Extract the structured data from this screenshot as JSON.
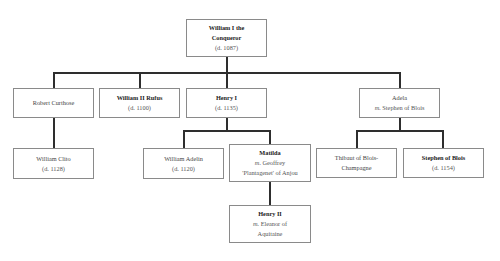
{
  "tree": {
    "william_i": {
      "name_line1": "William I the",
      "name_line2": "Conqueror",
      "died": "(d. 1087)"
    },
    "robert": {
      "name": "Robert Curthose"
    },
    "rufus": {
      "name": "William II Rufus",
      "died": "(d. 1100)"
    },
    "henry_i": {
      "name": "Henry I",
      "died": "(d. 1135)"
    },
    "adela": {
      "name": "Adela",
      "spouse_prefix": "m.",
      "spouse": "Stephen of Blois"
    },
    "clito": {
      "name": "William Clito",
      "died": "(d. 1128)"
    },
    "adelin": {
      "name": "William Adelin",
      "died": "(d. 1120)"
    },
    "matilda": {
      "name": "Matilda",
      "spouse_prefix": "m.",
      "spouse_line1": "Geoffrey",
      "spouse_line2": "'Plantagenet' of Anjou"
    },
    "thibaut": {
      "name_line1": "Thibaut of Blois-",
      "name_line2": "Champagne"
    },
    "stephen": {
      "name": "Stephen of Blois",
      "died": "(d. 1154)"
    },
    "henry_ii": {
      "name": "Henry II",
      "spouse_prefix": "m.",
      "spouse_line1": "Eleanor of",
      "spouse_line2": "Aquitaine"
    }
  },
  "colors": {
    "line": "#2e2e2e",
    "border": "#8a8a8a",
    "background": "#ffffff"
  }
}
